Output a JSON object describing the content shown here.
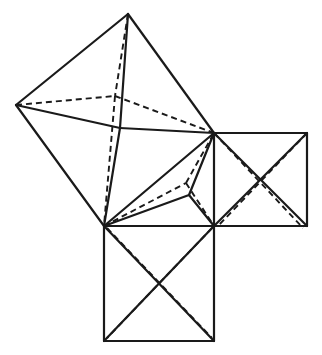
{
  "diagram": {
    "title": "",
    "stroke_color": "#1a1a1a",
    "background": "#ffffff",
    "points": {
      "big_top": [
        128,
        14
      ],
      "big_left": [
        16,
        105
      ],
      "big_right": [
        214,
        133
      ],
      "big_bottom": [
        104,
        226
      ],
      "big_apex_solid": [
        120,
        128
      ],
      "big_apex_dashed": [
        115,
        96
      ],
      "tri_apex_solid": [
        189,
        195
      ],
      "tri_apex_dashed": [
        186,
        183
      ],
      "right_sq_tl": [
        214,
        133
      ],
      "right_sq_tr": [
        307,
        133
      ],
      "right_sq_br": [
        307,
        226
      ],
      "right_sq_bl": [
        214,
        226
      ],
      "right_sq_apex": [
        260,
        180
      ],
      "bottom_sq_tl": [
        104,
        226
      ],
      "bottom_sq_tr": [
        214,
        226
      ],
      "bottom_sq_br": [
        214,
        341
      ],
      "bottom_sq_bl": [
        104,
        341
      ],
      "bottom_sq_apex": [
        159,
        284
      ]
    },
    "solid_edges": [
      [
        [
          128,
          14
        ],
        [
          16,
          105
        ]
      ],
      [
        [
          16,
          105
        ],
        [
          104,
          226
        ]
      ],
      [
        [
          104,
          226
        ],
        [
          214,
          133
        ]
      ],
      [
        [
          214,
          133
        ],
        [
          128,
          14
        ]
      ],
      [
        [
          16,
          105
        ],
        [
          120,
          128
        ]
      ],
      [
        [
          120,
          128
        ],
        [
          214,
          133
        ]
      ],
      [
        [
          128,
          14
        ],
        [
          120,
          128
        ]
      ],
      [
        [
          120,
          128
        ],
        [
          104,
          226
        ]
      ],
      [
        [
          104,
          226
        ],
        [
          189,
          195
        ]
      ],
      [
        [
          189,
          195
        ],
        [
          214,
          133
        ]
      ],
      [
        [
          189,
          195
        ],
        [
          214,
          226
        ]
      ],
      [
        [
          214,
          133
        ],
        [
          307,
          133
        ]
      ],
      [
        [
          307,
          133
        ],
        [
          307,
          226
        ]
      ],
      [
        [
          307,
          226
        ],
        [
          214,
          226
        ]
      ],
      [
        [
          214,
          226
        ],
        [
          214,
          133
        ]
      ],
      [
        [
          214,
          133
        ],
        [
          307,
          226
        ]
      ],
      [
        [
          307,
          133
        ],
        [
          214,
          226
        ]
      ],
      [
        [
          104,
          226
        ],
        [
          214,
          226
        ]
      ],
      [
        [
          214,
          226
        ],
        [
          214,
          341
        ]
      ],
      [
        [
          214,
          341
        ],
        [
          104,
          341
        ]
      ],
      [
        [
          104,
          341
        ],
        [
          104,
          226
        ]
      ],
      [
        [
          104,
          226
        ],
        [
          214,
          341
        ]
      ],
      [
        [
          214,
          226
        ],
        [
          104,
          341
        ]
      ]
    ],
    "dashed_edges": [
      [
        [
          16,
          105
        ],
        [
          115,
          96
        ]
      ],
      [
        [
          115,
          96
        ],
        [
          214,
          133
        ]
      ],
      [
        [
          128,
          14
        ],
        [
          115,
          96
        ]
      ],
      [
        [
          115,
          96
        ],
        [
          104,
          226
        ]
      ],
      [
        [
          104,
          226
        ],
        [
          186,
          183
        ]
      ],
      [
        [
          186,
          183
        ],
        [
          214,
          133
        ]
      ],
      [
        [
          186,
          183
        ],
        [
          214,
          226
        ]
      ],
      [
        [
          214,
          133
        ],
        [
          303,
          228
        ]
      ],
      [
        [
          307,
          133
        ],
        [
          218,
          226
        ]
      ],
      [
        [
          107,
          228
        ],
        [
          212,
          338
        ]
      ],
      [
        [
          212,
          228
        ],
        [
          107,
          338
        ]
      ]
    ]
  }
}
